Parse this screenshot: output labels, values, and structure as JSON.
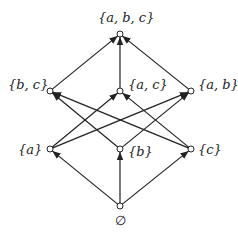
{
  "nodes": [
    {
      "id": "abc",
      "label": "{a, b, c}",
      "x": 120,
      "y": 34
    },
    {
      "id": "bc",
      "label": "{b, c}",
      "x": 50,
      "y": 91
    },
    {
      "id": "ac",
      "label": "{a, c}",
      "x": 120,
      "y": 91
    },
    {
      "id": "ab",
      "label": "{a, b}",
      "x": 191,
      "y": 91
    },
    {
      "id": "a",
      "label": "{a}",
      "x": 50,
      "y": 149
    },
    {
      "id": "b",
      "label": "{b}",
      "x": 120,
      "y": 149
    },
    {
      "id": "c",
      "label": "{c}",
      "x": 191,
      "y": 149
    },
    {
      "id": "empty",
      "label": "∅",
      "x": 120,
      "y": 206
    }
  ],
  "edges": [
    {
      "from": "empty",
      "to": "a"
    },
    {
      "from": "empty",
      "to": "b"
    },
    {
      "from": "empty",
      "to": "c"
    },
    {
      "from": "a",
      "to": "ac"
    },
    {
      "from": "a",
      "to": "ab"
    },
    {
      "from": "b",
      "to": "bc"
    },
    {
      "from": "b",
      "to": "ab"
    },
    {
      "from": "c",
      "to": "bc"
    },
    {
      "from": "c",
      "to": "ac"
    },
    {
      "from": "bc",
      "to": "abc"
    },
    {
      "from": "ac",
      "to": "abc"
    },
    {
      "from": "ab",
      "to": "abc"
    }
  ],
  "colors": {
    "line": "#222222",
    "node_fill": "#ffffff"
  }
}
